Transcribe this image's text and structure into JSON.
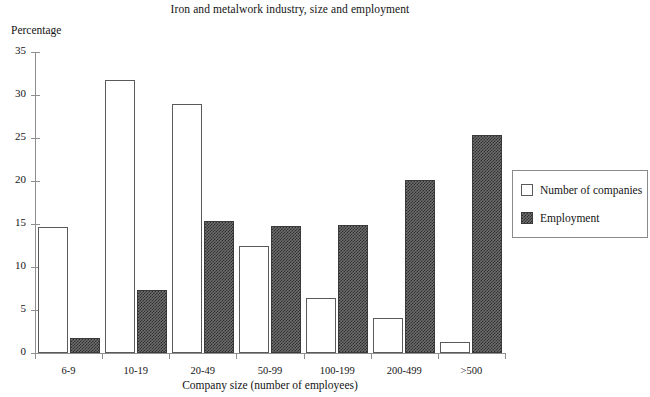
{
  "chart_data": {
    "type": "bar",
    "title": "Iron and metalwork industry, size and employment",
    "xlabel": "Company size (number of employees)",
    "ylabel": "Percentage",
    "categories": [
      "6-9",
      "10-19",
      "20-49",
      "50-99",
      "100-199",
      "200-499",
      ">500"
    ],
    "series": [
      {
        "name": "Number of companies",
        "values": [
          14.7,
          31.7,
          29.0,
          12.4,
          6.4,
          4.1,
          1.3
        ],
        "style": "open"
      },
      {
        "name": "Employment",
        "values": [
          1.7,
          7.3,
          15.3,
          14.8,
          14.9,
          20.1,
          25.4
        ],
        "style": "hatched-dark"
      }
    ],
    "ylim": [
      0,
      35
    ],
    "yticks": [
      0,
      5,
      10,
      15,
      20,
      25,
      30,
      35
    ],
    "ytick_labels": [
      "0",
      "5",
      "10",
      "15",
      "20",
      "25",
      "30",
      "35"
    ],
    "grid": false,
    "legend_position": "right-outside",
    "colors": {
      "companies_fill": "#ffffff",
      "companies_border": "#5a5a5a",
      "employment_fill": "#6e6e6e",
      "employment_hatch": "#2e2e2e",
      "axis": "#8f8f8f",
      "text": "#141414"
    }
  },
  "legend": {
    "items": [
      {
        "label": "Number of companies"
      },
      {
        "label": "Employment"
      }
    ]
  }
}
